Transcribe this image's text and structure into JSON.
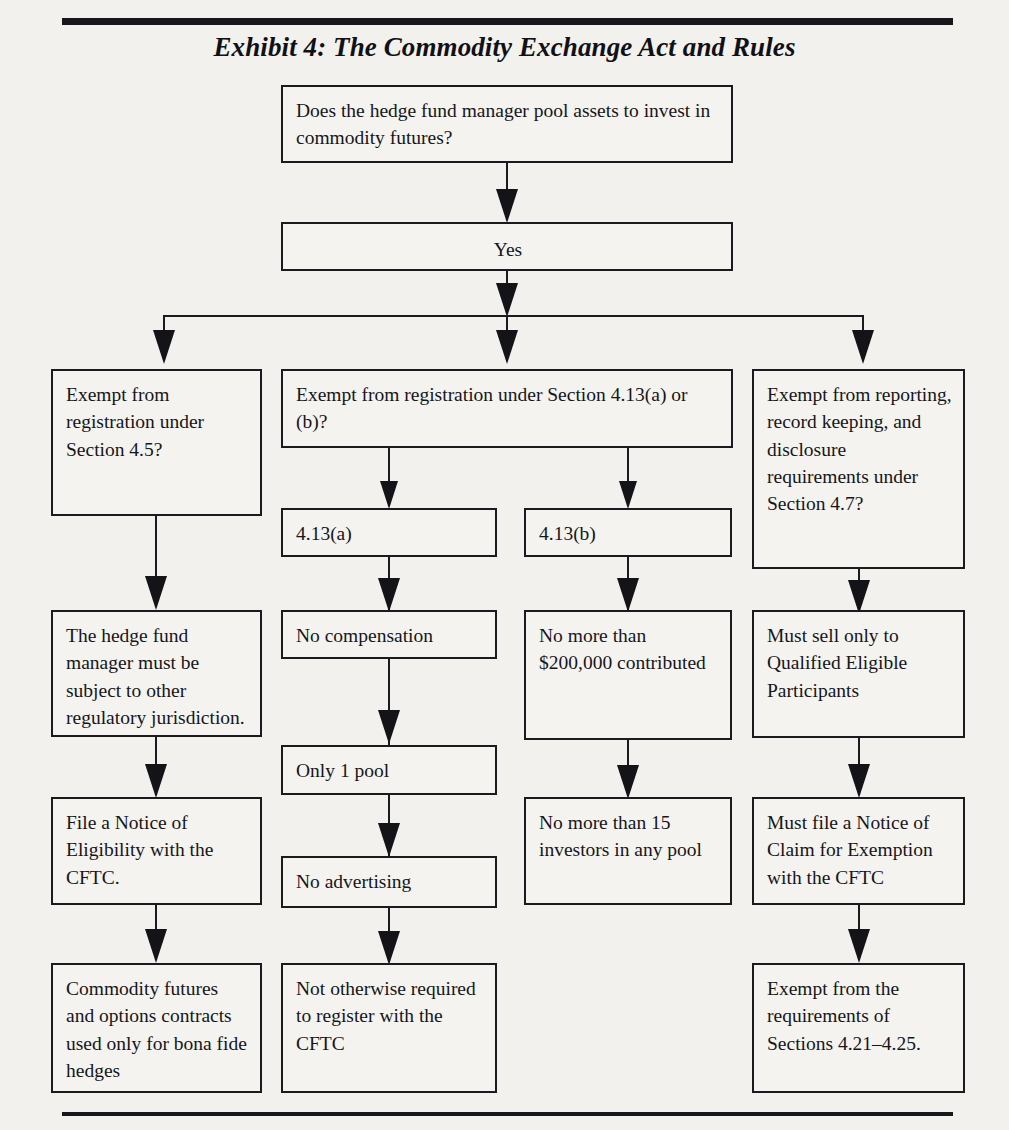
{
  "document": {
    "title": "Exhibit 4: The Commodity Exchange Act and Rules"
  },
  "flowchart": {
    "type": "flowchart",
    "nodes": {
      "root_question": "Does the hedge fund manager pool assets to invest in commodity futures?",
      "root_answer": "Yes",
      "branch1_question": "Exempt from registration under Section 4.5?",
      "branch2_question": "Exempt from registration under Section 4.13(a) or (b)?",
      "branch3_question": "Exempt from reporting, record keeping, and disclosure requirements under Section 4.7?",
      "sub_413a": "4.13(a)",
      "sub_413b": "4.13(b)",
      "col1_step1": "The hedge fund manager must be subject to other regulatory jurisdiction.",
      "col1_step2": "File a Notice of Eligibility with the CFTC.",
      "col1_step3": "Commodity futures and options contracts used only for bona fide hedges",
      "col2_step1": "No compensation",
      "col2_step2": "Only 1 pool",
      "col2_step3": "No advertising",
      "col2_step4": "Not otherwise required to register with the CFTC",
      "col3_step1": "No more than $200,000 contributed",
      "col3_step2": "No more than 15 investors in any pool",
      "col4_step1": "Must sell only to Qualified Eligible Participants",
      "col4_step2": "Must file a Notice of Claim for Exemption with the CFTC",
      "col4_step3": "Exempt from the requirements of Sections 4.21–4.25."
    },
    "colors": {
      "ink": "#16161a",
      "border": "#1a1a1f",
      "paper": "#f2f1ee",
      "box_fill": "#f4f3f0"
    }
  }
}
